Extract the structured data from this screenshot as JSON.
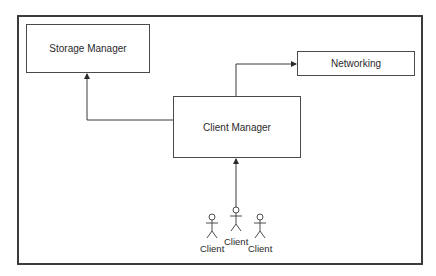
{
  "diagram": {
    "type": "architecture",
    "nodes": [
      {
        "id": "storage_manager",
        "label": "Storage Manager"
      },
      {
        "id": "networking",
        "label": "Networking"
      },
      {
        "id": "client_manager",
        "label": "Client Manager"
      }
    ],
    "actors": [
      {
        "id": "client_left",
        "label": "Client"
      },
      {
        "id": "client_center",
        "label": "Client"
      },
      {
        "id": "client_right",
        "label": "Client"
      }
    ],
    "edges": [
      {
        "from": "client_manager",
        "to": "storage_manager"
      },
      {
        "from": "client_manager",
        "to": "networking"
      },
      {
        "from": "client_center",
        "to": "client_manager"
      }
    ],
    "colors": {
      "stroke": "#3a3a3a",
      "background": "#ffffff",
      "text": "#2a2a2a"
    }
  }
}
